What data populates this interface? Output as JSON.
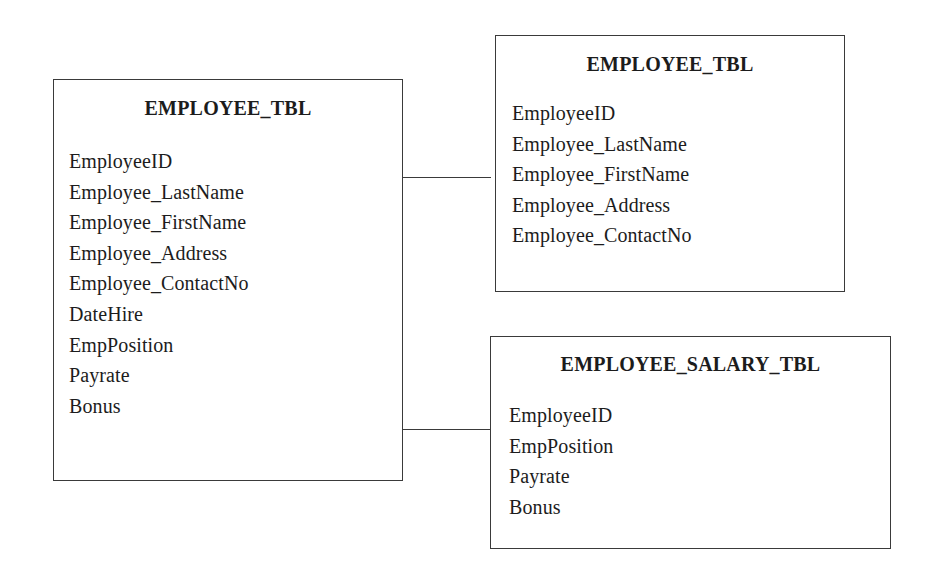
{
  "diagram": {
    "type": "database-table-normalization",
    "tables": [
      {
        "id": "left",
        "title": "EMPLOYEE_TBL",
        "fields": [
          "EmployeeID",
          "Employee_LastName",
          "Employee_FirstName",
          "Employee_Address",
          "Employee_ContactNo",
          "DateHire",
          "EmpPosition",
          "Payrate",
          "Bonus"
        ]
      },
      {
        "id": "top-right",
        "title": "EMPLOYEE_TBL",
        "fields": [
          "EmployeeID",
          "Employee_LastName",
          "Employee_FirstName",
          "Employee_Address",
          "Employee_ContactNo"
        ]
      },
      {
        "id": "bottom-right",
        "title": "EMPLOYEE_SALARY_TBL",
        "fields": [
          "EmployeeID",
          "EmpPosition",
          "Payrate",
          "Bonus"
        ]
      }
    ],
    "connectors": [
      {
        "from": "left",
        "to": "top-right"
      },
      {
        "from": "left",
        "to": "bottom-right"
      }
    ],
    "colors": {
      "border": "#3a3a3a",
      "text": "#1c1c1c",
      "background": "#ffffff"
    }
  }
}
